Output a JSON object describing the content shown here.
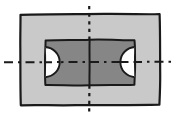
{
  "figure": {
    "title": "Technical drawing - plan view of rectangular plate with recessed pocket",
    "view_label": "",
    "style": "hand-drawn freehand sketch",
    "background_color": "#ffffff"
  },
  "canvas": {
    "width": 173,
    "height": 115
  },
  "colors": {
    "page_background": "#ffffff",
    "outer_plate_fill": "#c9c9c9",
    "inner_pocket_fill": "#868686",
    "semicircle_fill": "#fdfdfd",
    "outline_stroke": "#1a1a1a",
    "centerline_stroke": "#1a1a1a"
  },
  "geometry": {
    "outer_rect": {
      "name": "outer-plate",
      "x": 20,
      "y": 14,
      "width": 140,
      "height": 91,
      "fill": "#c9c9c9",
      "stroke_width": 2.2
    },
    "inner_rect": {
      "name": "inner-pocket",
      "x": 45,
      "y": 40,
      "width": 90,
      "height": 45,
      "fill": "#868686",
      "stroke_width": 2.0
    },
    "left_semicircle": {
      "name": "left-半-round",
      "center_x": 45,
      "center_y": 62,
      "radius": 15,
      "bulge": "right",
      "fill": "#fdfdfd"
    },
    "right_semicircle": {
      "name": "right-half-round",
      "center_x": 135,
      "center_y": 62,
      "radius": 15,
      "bulge": "left",
      "fill": "#fdfdfd"
    },
    "horizontal_centerline": {
      "y": 62,
      "x_start": 4,
      "x_end": 172,
      "pattern": "dash-dot",
      "stroke_width": 2.0
    },
    "vertical_centerline": {
      "x": 89,
      "y_start": 6,
      "y_end": 112,
      "pattern_outside": "dotted",
      "pattern_inside": "solid",
      "stroke_width": 2.0
    }
  },
  "annotations": {
    "labels": [],
    "dimensions": [],
    "notes": []
  }
}
